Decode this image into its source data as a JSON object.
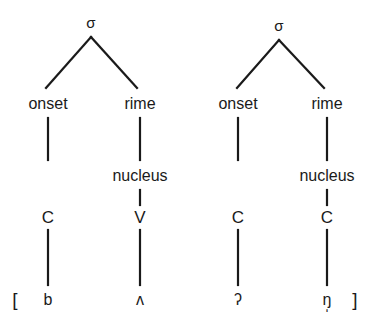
{
  "diagram": {
    "type": "syllable-structure-tree",
    "transcription_open_bracket": "[",
    "transcription_close_bracket": "]",
    "line_color": "#1a1a1a",
    "background_color": "#ffffff",
    "trees": [
      {
        "id": "syllable-1",
        "root": "σ",
        "onset_label": "onset",
        "rime_label": "rime",
        "nucleus_label": "nucleus",
        "onset_tier": "C",
        "nucleus_tier": "V",
        "onset_segment": "b",
        "nucleus_segment": "ʌ"
      },
      {
        "id": "syllable-2",
        "root": "σ",
        "onset_label": "onset",
        "rime_label": "rime",
        "nucleus_label": "nucleus",
        "onset_tier": "C",
        "nucleus_tier": "C",
        "onset_segment": "ʔ",
        "nucleus_segment": "ŋ̩"
      }
    ]
  }
}
